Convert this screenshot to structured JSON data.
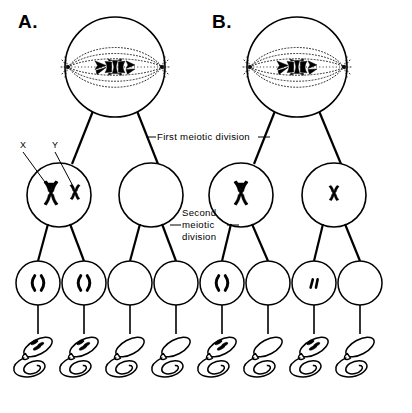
{
  "figure": {
    "panels": [
      {
        "id": "A",
        "label": "A.",
        "x": 18,
        "y": 28
      },
      {
        "id": "B",
        "label": "B.",
        "x": 212,
        "y": 28
      }
    ]
  },
  "annotations": {
    "first_division": {
      "text": "First meiotic division",
      "x": 205,
      "y": 140
    },
    "second_division": {
      "line1": "Second",
      "line2": "meiotic",
      "line3": "division",
      "x": 206,
      "y": 224
    },
    "chromosome_x": {
      "text": "X",
      "x": 20,
      "y": 148
    },
    "chromosome_y": {
      "text": "Y",
      "x": 52,
      "y": 148
    }
  },
  "colors": {
    "ink": "#000000",
    "background": "#ffffff",
    "spindle": "#111111"
  },
  "diagram_data": {
    "type": "diagram",
    "rows": [
      {
        "name": "primary-spermatocyte-metaphase-I",
        "stage": "Metaphase I",
        "cells": [
          {
            "panel": "A",
            "cx": 115,
            "cy": 67,
            "r": 50,
            "contents": "spindle-with-chromosomes"
          },
          {
            "panel": "B",
            "cx": 297,
            "cy": 67,
            "r": 50,
            "contents": "spindle-with-chromosomes"
          }
        ]
      },
      {
        "name": "secondary-spermatocytes",
        "stage": "After first meiotic division",
        "cells": [
          {
            "panel": "A",
            "cx": 59,
            "cy": 195,
            "r": 32,
            "contents": "X-and-Y-chromosome"
          },
          {
            "panel": "A",
            "cx": 151,
            "cy": 195,
            "r": 32,
            "contents": "empty"
          },
          {
            "panel": "B",
            "cx": 241,
            "cy": 195,
            "r": 32,
            "contents": "X-chromosome"
          },
          {
            "panel": "B",
            "cx": 334,
            "cy": 195,
            "r": 32,
            "contents": "Y-chromosome"
          }
        ]
      },
      {
        "name": "spermatids",
        "stage": "After second meiotic division",
        "cells": [
          {
            "panel": "A",
            "cx": 38,
            "cy": 283,
            "r": 22,
            "contents": "X-chromatids"
          },
          {
            "panel": "A",
            "cx": 84,
            "cy": 283,
            "r": 22,
            "contents": "X-chromatids"
          },
          {
            "panel": "A",
            "cx": 130,
            "cy": 283,
            "r": 22,
            "contents": "empty"
          },
          {
            "panel": "A",
            "cx": 176,
            "cy": 283,
            "r": 22,
            "contents": "empty"
          },
          {
            "panel": "B",
            "cx": 222,
            "cy": 283,
            "r": 22,
            "contents": "X-chromatids"
          },
          {
            "panel": "B",
            "cx": 268,
            "cy": 283,
            "r": 22,
            "contents": "empty"
          },
          {
            "panel": "B",
            "cx": 314,
            "cy": 283,
            "r": 22,
            "contents": "Y-chromatids"
          },
          {
            "panel": "B",
            "cx": 360,
            "cy": 283,
            "r": 22,
            "contents": "empty"
          }
        ]
      },
      {
        "name": "spermatozoa",
        "stage": "Mature sperm",
        "cells": [
          {
            "panel": "A",
            "cx": 38,
            "cy": 347,
            "contents": "chromatin"
          },
          {
            "panel": "A",
            "cx": 84,
            "cy": 347,
            "contents": "chromatin"
          },
          {
            "panel": "A",
            "cx": 130,
            "cy": 347,
            "contents": "empty"
          },
          {
            "panel": "A",
            "cx": 176,
            "cy": 347,
            "contents": "empty"
          },
          {
            "panel": "B",
            "cx": 222,
            "cy": 347,
            "contents": "chromatin"
          },
          {
            "panel": "B",
            "cx": 268,
            "cy": 347,
            "contents": "empty"
          },
          {
            "panel": "B",
            "cx": 314,
            "cy": 347,
            "contents": "chromatin"
          },
          {
            "panel": "B",
            "cx": 360,
            "cy": 347,
            "contents": "empty"
          }
        ]
      }
    ]
  }
}
